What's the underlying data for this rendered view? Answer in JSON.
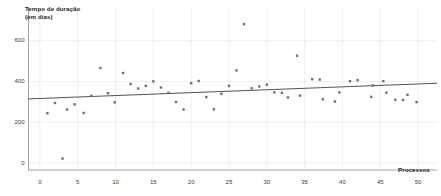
{
  "chart_data": {
    "type": "scatter",
    "title": "",
    "xlabel": "Processos",
    "ylabel": "Tempo de duração\n(em dias)",
    "ylabel_line1": "Tempo de duração",
    "ylabel_line2": "(em dias)",
    "xlim": [
      -1.5,
      52.5
    ],
    "ylim": [
      -30,
      720
    ],
    "xticks": [
      0,
      5,
      10,
      15,
      20,
      25,
      30,
      35,
      40,
      45,
      50
    ],
    "yticks": [
      0,
      200,
      400,
      600
    ],
    "grid": true,
    "grid_color": "#e8e8ea",
    "point_color": "#6f7073",
    "point_size": 2.4,
    "trendline": {
      "color": "#53544f",
      "width": 1.0,
      "x_start": -1.5,
      "y_start": 315,
      "x_end": 52.5,
      "y_end": 392
    },
    "series": [
      {
        "name": "Tempo de duração por processo",
        "points": [
          {
            "x": 1,
            "y": 245
          },
          {
            "x": 2,
            "y": 295
          },
          {
            "x": 3,
            "y": 22
          },
          {
            "x": 3.6,
            "y": 263
          },
          {
            "x": 4.6,
            "y": 288
          },
          {
            "x": 5.8,
            "y": 246
          },
          {
            "x": 6.8,
            "y": 330
          },
          {
            "x": 8,
            "y": 467
          },
          {
            "x": 9,
            "y": 343
          },
          {
            "x": 9.9,
            "y": 298
          },
          {
            "x": 11,
            "y": 442
          },
          {
            "x": 12,
            "y": 388
          },
          {
            "x": 13,
            "y": 366
          },
          {
            "x": 14,
            "y": 379
          },
          {
            "x": 15,
            "y": 401
          },
          {
            "x": 16,
            "y": 371
          },
          {
            "x": 17,
            "y": 345
          },
          {
            "x": 18,
            "y": 300
          },
          {
            "x": 19,
            "y": 263
          },
          {
            "x": 20,
            "y": 392
          },
          {
            "x": 21,
            "y": 403
          },
          {
            "x": 22,
            "y": 324
          },
          {
            "x": 23,
            "y": 264
          },
          {
            "x": 24,
            "y": 340
          },
          {
            "x": 25,
            "y": 379
          },
          {
            "x": 26,
            "y": 455
          },
          {
            "x": 27,
            "y": 682
          },
          {
            "x": 28,
            "y": 367
          },
          {
            "x": 29,
            "y": 376
          },
          {
            "x": 30,
            "y": 385
          },
          {
            "x": 31,
            "y": 347
          },
          {
            "x": 32,
            "y": 345
          },
          {
            "x": 32.8,
            "y": 322
          },
          {
            "x": 34,
            "y": 527
          },
          {
            "x": 34.4,
            "y": 331
          },
          {
            "x": 36,
            "y": 412
          },
          {
            "x": 37,
            "y": 410
          },
          {
            "x": 37.4,
            "y": 313
          },
          {
            "x": 39,
            "y": 302
          },
          {
            "x": 39.6,
            "y": 347
          },
          {
            "x": 41,
            "y": 402
          },
          {
            "x": 42,
            "y": 407
          },
          {
            "x": 43.8,
            "y": 325
          },
          {
            "x": 44,
            "y": 381
          },
          {
            "x": 45.4,
            "y": 402
          },
          {
            "x": 45.8,
            "y": 346
          },
          {
            "x": 47,
            "y": 311
          },
          {
            "x": 48,
            "y": 310
          },
          {
            "x": 48.6,
            "y": 335
          },
          {
            "x": 49.8,
            "y": 299
          }
        ]
      }
    ]
  }
}
